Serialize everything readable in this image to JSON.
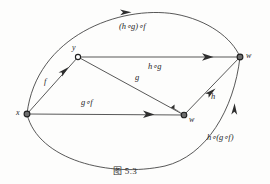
{
  "figure": {
    "caption": "图 5.3",
    "background_color": "#fdfdfc",
    "stroke_color": "#3a3a3a",
    "text_color": "#262626"
  },
  "vertices": [
    {
      "id": "x",
      "label": "x",
      "x": 27,
      "y": 114
    },
    {
      "id": "y",
      "label": "y",
      "x": 78,
      "y": 57
    },
    {
      "id": "z",
      "label": "z",
      "x": 184,
      "y": 115
    },
    {
      "id": "w",
      "label": "w",
      "x": 240,
      "y": 57
    }
  ],
  "edges": [
    {
      "id": "f",
      "label": "f",
      "from": "x",
      "to": "y",
      "kind": "straight"
    },
    {
      "id": "g",
      "label": "g",
      "from": "y",
      "to": "z",
      "kind": "straight"
    },
    {
      "id": "h",
      "label": "h",
      "from": "z",
      "to": "w",
      "kind": "straight"
    },
    {
      "id": "hg",
      "label": "h∘g",
      "from": "y",
      "to": "w",
      "kind": "straight"
    },
    {
      "id": "gf",
      "label": "g∘f",
      "from": "x",
      "to": "z",
      "kind": "straight"
    },
    {
      "id": "hg_f",
      "label": "(h∘g)∘f",
      "from": "x",
      "to": "w",
      "kind": "arc-upper"
    },
    {
      "id": "h_gf",
      "label": "h∘(g∘f)",
      "from": "x",
      "to": "w",
      "kind": "arc-lower"
    }
  ],
  "labels": {
    "f": "f",
    "g": "g",
    "h": "h",
    "h_comp_g": "h∘g",
    "g_comp_f": "g∘f",
    "hg_comp_f": "(h∘g)∘f",
    "h_comp_gf": "h∘(g∘f)"
  }
}
